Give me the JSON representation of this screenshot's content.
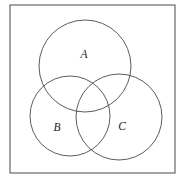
{
  "figure": {
    "type": "venn-diagram",
    "title": "",
    "background_color": "#ffffff",
    "frame": {
      "name": "outer-border",
      "x": 10,
      "y": 5,
      "width": 165,
      "height": 168,
      "stroke_color": "#5a5a5a",
      "stroke_width": 1.1,
      "fill_color": "#ffffff"
    },
    "circle_stroke_color": "#4a4a4a",
    "circle_stroke_width": 0.9,
    "label_color": "#1a1a1a",
    "sets": [
      {
        "id": "A",
        "label": "A",
        "cx": 85,
        "cy": 66,
        "r": 46,
        "label_x": 84,
        "label_y": 55
      },
      {
        "id": "B",
        "label": "B",
        "cx": 70,
        "cy": 116,
        "r": 40,
        "label_x": 57,
        "label_y": 128
      },
      {
        "id": "C",
        "label": "C",
        "cx": 119,
        "cy": 117,
        "r": 43,
        "label_x": 122,
        "label_y": 127
      }
    ]
  }
}
